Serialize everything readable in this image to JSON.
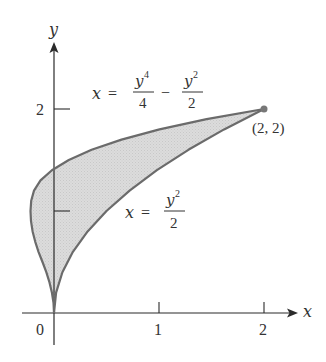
{
  "figure": {
    "axes": {
      "x_label": "x",
      "y_label": "y",
      "origin_label": "0",
      "x_ticks": [
        {
          "value": 1,
          "label": "1"
        },
        {
          "value": 2,
          "label": "2"
        }
      ],
      "y_ticks": [
        {
          "value": 1,
          "label": ""
        },
        {
          "value": 2,
          "label": "2"
        }
      ]
    },
    "curves": [
      {
        "name": "left-curve",
        "equation": "x = y^4/4 - y^2/2",
        "label": {
          "lhs": "x",
          "eq": "=",
          "num1_base": "y",
          "num1_exp": "4",
          "den1": "4",
          "minus": "−",
          "num2_base": "y",
          "num2_exp": "2",
          "den2": "2"
        }
      },
      {
        "name": "right-curve",
        "equation": "x = y^2/2",
        "label": {
          "lhs": "x",
          "eq": "=",
          "num_base": "y",
          "num_exp": "2",
          "den": "2"
        }
      }
    ],
    "intersection_point": {
      "x": 2,
      "y": 2,
      "label": "(2, 2)"
    },
    "region": {
      "description": "region enclosed between the two curves from (0,0) to (2,2)"
    },
    "colors": {
      "fill": "#d9d9d9",
      "curve_stroke": "#6b6b6b",
      "axis": "#2b2b2b",
      "text": "#333333",
      "point": "#777777"
    }
  }
}
